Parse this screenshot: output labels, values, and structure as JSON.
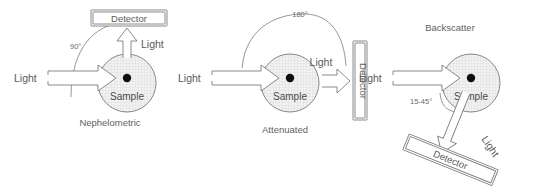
{
  "figure": {
    "title": "",
    "background_color": "#ffffff",
    "line_color": "#7d7d7d",
    "text_color": "#5a5a5a",
    "sample_fill_color": "#f0f0f0",
    "center_dot_color": "#0d0d0d"
  },
  "panels": [
    {
      "id": "nephelometric",
      "caption": "Nephelometric",
      "angle_label": "90°",
      "sample_label": "Sample",
      "incident_light_label": "Light",
      "scattered_light_label": "Light",
      "detector_label": "Detector",
      "detector_orientation": "horizontal",
      "detector_position": "above-sample",
      "scatter_direction": "up"
    },
    {
      "id": "attenuated",
      "caption": "Attenuated",
      "angle_label": "180°",
      "sample_label": "Sample",
      "incident_light_label": "Light",
      "scattered_light_label": "Light",
      "detector_label": "Detector",
      "detector_orientation": "vertical",
      "detector_position": "right-of-sample",
      "scatter_direction": "right"
    },
    {
      "id": "backscatter",
      "caption": "Backscatter",
      "angle_label": "15-45°",
      "sample_label": "Sample",
      "incident_light_label": "Light",
      "scattered_light_label": "Light",
      "detector_label": "Detector",
      "detector_orientation": "diagonal",
      "detector_position": "below-left-of-sample",
      "scatter_direction": "down-left"
    }
  ]
}
